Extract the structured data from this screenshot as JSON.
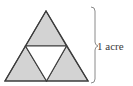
{
  "diagram": {
    "type": "sierpinski-triangle-area",
    "label": "1 acre",
    "colors": {
      "fill": "#d3d3d3",
      "stroke": "#3c3c3c",
      "inner": "#ffffff",
      "brace": "#8a8a8a",
      "text": "#3a3a3a"
    },
    "outer_triangle": {
      "apex": [
        46,
        11
      ],
      "bottom_left": [
        5,
        81
      ],
      "bottom_right": [
        88,
        81
      ]
    },
    "inner_removed_triangle": {
      "top_left": [
        25.5,
        46
      ],
      "top_right": [
        66.5,
        46
      ],
      "bottom": [
        46.5,
        81
      ]
    },
    "shaded_sub_triangles": 3,
    "removed_sub_triangles": 1
  }
}
